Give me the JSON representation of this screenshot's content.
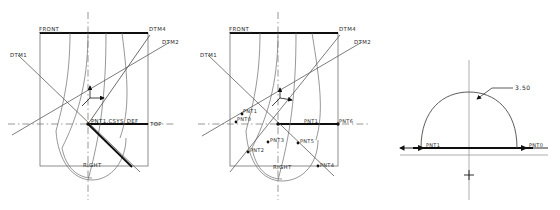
{
  "drawing": {
    "type": "cad-datum-views",
    "background_color": "#ffffff",
    "line_color": "#4a4a4a",
    "heavy_line_color": "#111111",
    "text_color": "#2a2a2a"
  },
  "views": [
    {
      "id": "view-left",
      "name": "datum-view-1",
      "labels": {
        "front": "FRONT",
        "top": "TOP",
        "right": "RIGHT",
        "dtm1": "DTM1",
        "dtm2": "DTM2",
        "dtm4": "DTM4",
        "origin": "PNT1,CSYS_DEF"
      }
    },
    {
      "id": "view-middle",
      "name": "datum-view-2",
      "labels": {
        "front": "FRONT",
        "right": "RIGHT",
        "dtm1": "DTM1",
        "dtm2": "DTM2",
        "dtm4": "DTM4",
        "pnt0": "PNT0",
        "pnt1": "PNT1",
        "pnt2": "PNT2",
        "pnt3": "PNT3",
        "pnt4": "PNT4",
        "pnt5": "PNT5",
        "pnt6": "PNT6",
        "pnt_center": "PNT1"
      }
    },
    {
      "id": "view-right",
      "name": "arc-detail-view",
      "labels": {
        "dimension": "3.50",
        "pnt1": "PNT1",
        "pnt0": "PNT0"
      }
    }
  ]
}
